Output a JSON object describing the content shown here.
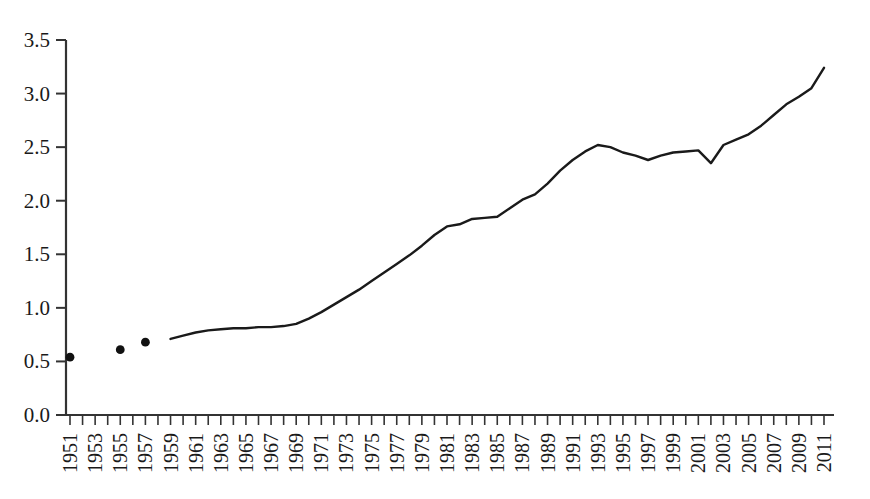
{
  "chart_data": {
    "type": "line",
    "title": "",
    "subtitle": "",
    "xlabel": "",
    "ylabel": "",
    "xlim": [
      1951,
      2011
    ],
    "ylim": [
      0.0,
      3.5
    ],
    "grid": false,
    "legend": null,
    "y_ticks": [
      "0.0",
      "0.5",
      "1.0",
      "1.5",
      "2.0",
      "2.5",
      "3.0",
      "3.5"
    ],
    "y_tick_values": [
      0.0,
      0.5,
      1.0,
      1.5,
      2.0,
      2.5,
      3.0,
      3.5
    ],
    "x_tick_labels": [
      "1951",
      "1953",
      "1955",
      "1957",
      "1959",
      "1961",
      "1963",
      "1965",
      "1967",
      "1969",
      "1971",
      "1973",
      "1975",
      "1977",
      "1979",
      "1981",
      "1983",
      "1985",
      "1987",
      "1989",
      "1991",
      "1993",
      "1995",
      "1997",
      "1999",
      "2001",
      "2003",
      "2005",
      "2007",
      "2009",
      "2011"
    ],
    "x_tick_label_rotation": -90,
    "x_minor_tick_years": [
      1951,
      1952,
      1953,
      1954,
      1955,
      1956,
      1957,
      1958,
      1959,
      1960,
      1961,
      1962,
      1963,
      1964,
      1965,
      1966,
      1967,
      1968,
      1969,
      1970,
      1971,
      1972,
      1973,
      1974,
      1975,
      1976,
      1977,
      1978,
      1979,
      1980,
      1981,
      1982,
      1983,
      1984,
      1985,
      1986,
      1987,
      1988,
      1989,
      1990,
      1991,
      1992,
      1993,
      1994,
      1995,
      1996,
      1997,
      1998,
      1999,
      2000,
      2001,
      2002,
      2003,
      2004,
      2005,
      2006,
      2007,
      2008,
      2009,
      2010,
      2011
    ],
    "series": [
      {
        "name": "scatter-points",
        "style": "markers",
        "marker": "circle",
        "color": "#111111",
        "x": [
          1951,
          1955,
          1957
        ],
        "values": [
          0.54,
          0.61,
          0.68
        ]
      },
      {
        "name": "line-series",
        "style": "line",
        "color": "#1a1a1a",
        "x": [
          1959,
          1960,
          1961,
          1962,
          1963,
          1964,
          1965,
          1966,
          1967,
          1968,
          1969,
          1970,
          1971,
          1972,
          1973,
          1974,
          1975,
          1976,
          1977,
          1978,
          1979,
          1980,
          1981,
          1982,
          1983,
          1984,
          1985,
          1986,
          1987,
          1988,
          1989,
          1990,
          1991,
          1992,
          1993,
          1994,
          1995,
          1996,
          1997,
          1998,
          1999,
          2000,
          2001,
          2002,
          2003,
          2004,
          2005,
          2006,
          2007,
          2008,
          2009,
          2010,
          2011
        ],
        "values": [
          0.71,
          0.74,
          0.77,
          0.79,
          0.8,
          0.81,
          0.81,
          0.82,
          0.82,
          0.83,
          0.85,
          0.9,
          0.96,
          1.03,
          1.1,
          1.17,
          1.25,
          1.33,
          1.41,
          1.49,
          1.58,
          1.68,
          1.76,
          1.78,
          1.83,
          1.84,
          1.85,
          1.93,
          2.01,
          2.06,
          2.16,
          2.28,
          2.38,
          2.46,
          2.52,
          2.5,
          2.45,
          2.42,
          2.38,
          2.42,
          2.45,
          2.46,
          2.47,
          2.35,
          2.52,
          2.57,
          2.62,
          2.7,
          2.8,
          2.9,
          2.97,
          3.05,
          3.24
        ]
      }
    ],
    "axis": {
      "spine_color": "#333333",
      "tick_direction": "out",
      "left_spine": true,
      "bottom_spine": true,
      "top_spine": false,
      "right_spine": false
    }
  },
  "figure": {
    "background_color": "#ffffff",
    "line_color": "#1a1a1a",
    "marker_color": "#111111"
  }
}
